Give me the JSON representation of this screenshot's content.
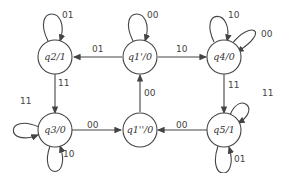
{
  "diagram": {
    "type": "state-machine",
    "states": [
      {
        "id": "q2",
        "label": "q2/1"
      },
      {
        "id": "q1p",
        "label": "q1'/0"
      },
      {
        "id": "q4",
        "label": "q4/0"
      },
      {
        "id": "q3",
        "label": "q3/0"
      },
      {
        "id": "q1pp",
        "label": "q1''/0"
      },
      {
        "id": "q5",
        "label": "q5/1"
      }
    ],
    "edges": [
      {
        "from": "q2",
        "to": "q2",
        "label": "01"
      },
      {
        "from": "q1p",
        "to": "q1p",
        "label": "00"
      },
      {
        "from": "q4",
        "to": "q4",
        "label": "10"
      },
      {
        "from": "q4",
        "to": "q4",
        "label": "00"
      },
      {
        "from": "q1p",
        "to": "q2",
        "label": "01"
      },
      {
        "from": "q1p",
        "to": "q4",
        "label": "10"
      },
      {
        "from": "q2",
        "to": "q3",
        "label": "11"
      },
      {
        "from": "q1pp",
        "to": "q1p",
        "label": "00"
      },
      {
        "from": "q4",
        "to": "q5",
        "label": "11"
      },
      {
        "from": "q3",
        "to": "q3",
        "label": "11"
      },
      {
        "from": "q3",
        "to": "q3",
        "label": "10"
      },
      {
        "from": "q3",
        "to": "q1pp",
        "label": "00"
      },
      {
        "from": "q5",
        "to": "q1pp",
        "label": "00"
      },
      {
        "from": "q5",
        "to": "q5",
        "label": "11"
      },
      {
        "from": "q5",
        "to": "q5",
        "label": "01"
      }
    ]
  }
}
